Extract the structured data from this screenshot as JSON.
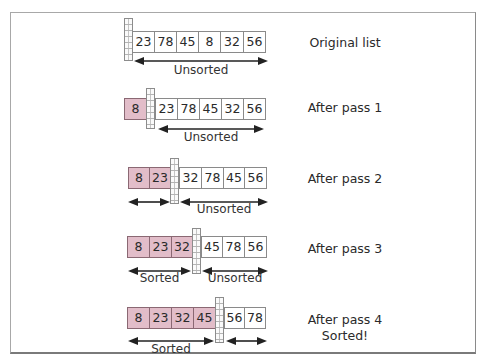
{
  "colors": {
    "sorted_fill": "#e2bdc9",
    "unsorted_fill": "#ffffff",
    "border": "#8a8a8a"
  },
  "rows": [
    {
      "label": "Original list",
      "sorted": [],
      "unsorted": [
        "23",
        "78",
        "45",
        "8",
        "32",
        "56"
      ],
      "sorted_arrow_label": "",
      "unsorted_arrow_label": "Unsorted"
    },
    {
      "label": "After pass 1",
      "sorted": [
        "8"
      ],
      "unsorted": [
        "23",
        "78",
        "45",
        "32",
        "56"
      ],
      "sorted_arrow_label": "",
      "unsorted_arrow_label": "Unsorted"
    },
    {
      "label": "After pass 2",
      "sorted": [
        "8",
        "23"
      ],
      "unsorted": [
        "32",
        "78",
        "45",
        "56"
      ],
      "sorted_arrow_label": "",
      "unsorted_arrow_label": "Unsorted"
    },
    {
      "label": "After pass 3",
      "sorted": [
        "8",
        "23",
        "32"
      ],
      "unsorted": [
        "45",
        "78",
        "56"
      ],
      "sorted_arrow_label": "Sorted",
      "unsorted_arrow_label": "Unsorted"
    },
    {
      "label": "After pass 4",
      "label2": "Sorted!",
      "sorted": [
        "8",
        "23",
        "32",
        "45"
      ],
      "unsorted": [
        "56",
        "78"
      ],
      "sorted_arrow_label": "Sorted",
      "unsorted_arrow_label": ""
    }
  ]
}
